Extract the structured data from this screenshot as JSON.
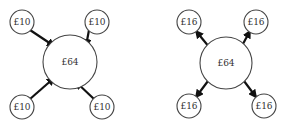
{
  "diagrams": [
    {
      "name": "inflow",
      "center": {
        "label": "£64",
        "cx": 70,
        "cy": 62,
        "r": 27
      },
      "nodes": [
        {
          "label": "£10",
          "cx": 22,
          "cy": 22,
          "r": 12
        },
        {
          "label": "£10",
          "cx": 97,
          "cy": 22,
          "r": 12
        },
        {
          "label": "£10",
          "cx": 22,
          "cy": 107,
          "r": 12
        },
        {
          "label": "£10",
          "cx": 102,
          "cy": 107,
          "r": 12
        }
      ],
      "arrow_direction": "inward"
    },
    {
      "name": "outflow",
      "center": {
        "label": "£64",
        "cx": 226,
        "cy": 63,
        "r": 26
      },
      "nodes": [
        {
          "label": "£16",
          "cx": 189,
          "cy": 22,
          "r": 12
        },
        {
          "label": "£16",
          "cx": 256,
          "cy": 22,
          "r": 12
        },
        {
          "label": "£16",
          "cx": 189,
          "cy": 106,
          "r": 12
        },
        {
          "label": "£16",
          "cx": 264,
          "cy": 106,
          "r": 12
        }
      ],
      "arrow_direction": "outward"
    }
  ],
  "colors": {
    "stroke": "#444444",
    "arrow": "#111111",
    "text": "#333333",
    "background": "#ffffff"
  }
}
